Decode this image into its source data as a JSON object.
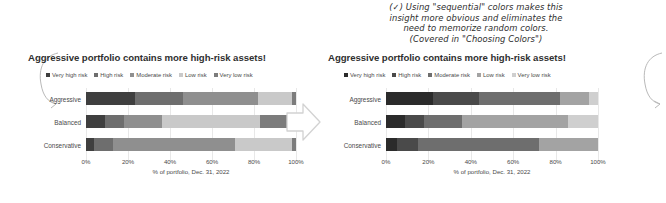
{
  "annotation": {
    "lines": [
      "(✓) Using \"sequential\" colors makes this",
      "insight more obvious and eliminates the",
      "need to memorize random colors.",
      "(Covered in \"Choosing Colors\")"
    ]
  },
  "axis": {
    "ticks": [
      "0%",
      "20%",
      "40%",
      "60%",
      "80%",
      "100%"
    ],
    "tick_values": [
      0,
      20,
      40,
      60,
      80,
      100
    ],
    "title": "% of portfolio, Dec. 31, 2022",
    "xlim": [
      0,
      100
    ]
  },
  "legend": {
    "labels": [
      "Very high risk",
      "High risk",
      "Moderate risk",
      "Low risk",
      "Very low risk"
    ]
  },
  "categories": [
    "Aggressive",
    "Balanced",
    "Conservative"
  ],
  "left_chart": {
    "title": "Aggressive portfolio contains more high-risk assets!",
    "palette": [
      "#3f3f3f",
      "#6e6e6e",
      "#8f8f8f",
      "#c9c9c9",
      "#7c7c7c"
    ]
  },
  "right_chart": {
    "title": "Aggressive portfolio contains more high-risk assets!",
    "palette": [
      "#2b2b2b",
      "#4a4a4a",
      "#6e6e6e",
      "#a3a3a3",
      "#cfcfcf"
    ]
  },
  "chart_data": [
    {
      "type": "bar",
      "orientation": "horizontal",
      "stacked": true,
      "normalized": true,
      "id": "left-random-colors",
      "title": "Aggressive portfolio contains more high-risk assets!",
      "xlabel": "% of portfolio, Dec. 31, 2022",
      "ylabel": "",
      "xlim": [
        0,
        100
      ],
      "xticks": [
        0,
        20,
        40,
        60,
        80,
        100
      ],
      "xticklabels": [
        "0%",
        "20%",
        "40%",
        "60%",
        "80%",
        "100%"
      ],
      "grid": true,
      "legend": "top",
      "categories": [
        "Aggressive",
        "Balanced",
        "Conservative"
      ],
      "series": [
        {
          "name": "Very high risk",
          "color": "#3f3f3f",
          "values": [
            22,
            9,
            4
          ]
        },
        {
          "name": "High risk",
          "color": "#6e6e6e",
          "values": [
            22,
            9,
            9
          ]
        },
        {
          "name": "Moderate risk",
          "color": "#8f8f8f",
          "values": [
            34,
            18,
            58
          ]
        },
        {
          "name": "Low risk",
          "color": "#c9c9c9",
          "values": [
            15,
            46,
            27
          ]
        },
        {
          "name": "Very low risk",
          "color": "#7c7c7c",
          "values": [
            2,
            17,
            2
          ]
        }
      ]
    },
    {
      "type": "bar",
      "orientation": "horizontal",
      "stacked": true,
      "normalized": true,
      "id": "right-sequential-colors",
      "title": "Aggressive portfolio contains more high-risk assets!",
      "xlabel": "% of portfolio, Dec. 31, 2022",
      "ylabel": "",
      "xlim": [
        0,
        100
      ],
      "xticks": [
        0,
        20,
        40,
        60,
        80,
        100
      ],
      "xticklabels": [
        "0%",
        "20%",
        "40%",
        "60%",
        "80%",
        "100%"
      ],
      "grid": true,
      "legend": "top",
      "categories": [
        "Aggressive",
        "Balanced",
        "Conservative"
      ],
      "series": [
        {
          "name": "Very high risk",
          "color": "#2b2b2b",
          "values": [
            22,
            9,
            5
          ]
        },
        {
          "name": "High risk",
          "color": "#4a4a4a",
          "values": [
            22,
            9,
            10
          ]
        },
        {
          "name": "Moderate risk",
          "color": "#6e6e6e",
          "values": [
            38,
            18,
            57
          ]
        },
        {
          "name": "Low risk",
          "color": "#a3a3a3",
          "values": [
            14,
            50,
            28
          ]
        },
        {
          "name": "Very low risk",
          "color": "#cfcfcf",
          "values": [
            4,
            14,
            0
          ]
        }
      ]
    }
  ]
}
